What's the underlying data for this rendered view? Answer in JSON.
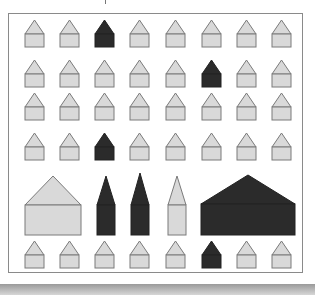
{
  "figure": {
    "colors": {
      "light_fill": "#d9d9d9",
      "dark_fill": "#2b2b2b",
      "stroke": "#7a7a7a",
      "frame": "#8a8a8a"
    },
    "small_house": {
      "width": 19,
      "roof_height": 14,
      "body_height": 13
    },
    "columns_x": [
      25,
      60,
      95,
      130,
      166,
      202,
      237,
      272
    ],
    "grid_rows": [
      {
        "apex_y": 20,
        "dark_columns": [
          2
        ]
      },
      {
        "apex_y": 60,
        "dark_columns": [
          5
        ]
      },
      {
        "apex_y": 93,
        "dark_columns": []
      },
      {
        "apex_y": 133,
        "dark_columns": [
          2
        ]
      },
      {
        "apex_y": 241,
        "dark_columns": [
          5
        ]
      }
    ],
    "large_row": [
      {
        "name": "large-light-house",
        "shape": "house",
        "dark": false,
        "x": 25,
        "w": 56,
        "apex_y": 176,
        "eave_y": 205,
        "bottom_y": 235
      },
      {
        "name": "dark-tower-1",
        "shape": "tower",
        "dark": true,
        "x": 97,
        "w": 18,
        "apex_y": 176,
        "eave_y": 205,
        "bottom_y": 235
      },
      {
        "name": "dark-tower-2",
        "shape": "tower",
        "dark": true,
        "x": 131,
        "w": 18,
        "apex_y": 173,
        "eave_y": 205,
        "bottom_y": 235
      },
      {
        "name": "light-tower",
        "shape": "tower",
        "dark": false,
        "x": 168,
        "w": 18,
        "apex_y": 176,
        "eave_y": 205,
        "bottom_y": 235
      },
      {
        "name": "large-dark-house",
        "shape": "house",
        "dark": true,
        "x": 201,
        "w": 94,
        "apex_y": 175,
        "eave_y": 204,
        "bottom_y": 235
      }
    ]
  }
}
